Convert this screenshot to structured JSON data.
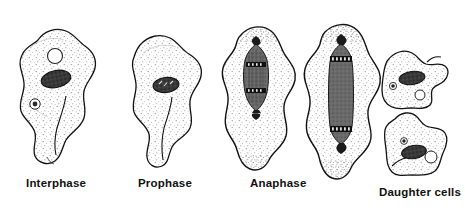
{
  "figure": {
    "background_color": "#ffffff",
    "ink_color": "#111111",
    "nucleus_color": "#3a3a3a",
    "spindle_color": "#6a6a6a",
    "cytoplasm_color": "#ffffff",
    "stipple_color": "#555555"
  },
  "labels": {
    "interphase": "Interphase",
    "prophase": "Prophase",
    "anaphase": "Anaphase",
    "daughter_cells": "Daughter cells"
  },
  "cells": [
    {
      "id": "interphase-cell",
      "stage": "Interphase",
      "description": "Amoeboid cell with pseudopod at lower right, dark elliptical nucleus, clear round vacuole above nucleus, small contractile vacuole at left",
      "organelles": [
        "nucleus",
        "food-vacuole",
        "contractile-vacuole"
      ]
    },
    {
      "id": "prophase-cell",
      "stage": "Prophase",
      "description": "Amoeboid cell with broad pseudopod below, single dark condensed chromatin mass near center",
      "organelles": [
        "condensed-nucleus"
      ]
    },
    {
      "id": "anaphase-cell-1",
      "stage": "Anaphase",
      "description": "Elongated cell with dark spindle-shaped mitotic apparatus, pointed poles top and bottom, chromosome bands at each end",
      "organelles": [
        "mitotic-spindle",
        "chromosomes"
      ]
    },
    {
      "id": "anaphase-cell-2",
      "stage": "Anaphase",
      "description": "Further elongated cell with long grey spindle body, dark chromosome groups near both poles, cell beginning to constrict",
      "organelles": [
        "mitotic-spindle",
        "chromosomes"
      ]
    },
    {
      "id": "daughter-cell-upper",
      "stage": "Daughter cells",
      "description": "Small amoeboid cell with dark elliptical nucleus, small dark granule at left, clear vacuole at lower right",
      "organelles": [
        "nucleus",
        "granule",
        "vacuole"
      ]
    },
    {
      "id": "daughter-cell-lower",
      "stage": "Daughter cells",
      "description": "Small amoeboid cell with dark elliptical nucleus, small dark granule above left, clear round vacuole at right",
      "organelles": [
        "nucleus",
        "granule",
        "vacuole"
      ]
    }
  ]
}
